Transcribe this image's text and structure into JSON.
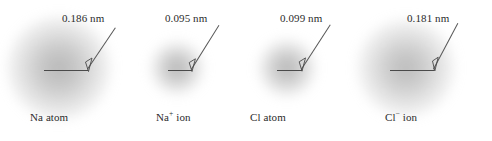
{
  "figure": {
    "background_color": "#ffffff",
    "text_color": "#2b2b2b",
    "line_color": "#4a4a4a",
    "cloud_color": "#9a9a9a",
    "units": "nm"
  },
  "panels": [
    {
      "id": "na-atom",
      "species_label": "Na atom",
      "species_symbol": "Na",
      "charge": "",
      "measure_label": "0.186 nm",
      "radius_nm": 0.186,
      "cloud_diameter_px": 104,
      "cloud_center_x": 59,
      "cloud_center_y": 68,
      "radius_line_left": 44,
      "radius_line_right": 88,
      "radius_line_y": 70,
      "label_x": 62,
      "label_y": 14
    },
    {
      "id": "na-ion",
      "species_label": "Na+ ion",
      "species_symbol": "Na",
      "charge": "+",
      "measure_label": "0.095 nm",
      "radius_nm": 0.095,
      "cloud_diameter_px": 54,
      "cloud_center_x": 177,
      "cloud_center_y": 68,
      "radius_line_left": 168,
      "radius_line_right": 192,
      "radius_line_y": 70,
      "label_x": 177,
      "label_y": 14
    },
    {
      "id": "cl-atom",
      "species_label": "Cl atom",
      "species_symbol": "Cl",
      "charge": "",
      "measure_label": "0.099 nm",
      "radius_nm": 0.099,
      "cloud_diameter_px": 58,
      "cloud_center_x": 287,
      "cloud_center_y": 68,
      "radius_line_left": 277,
      "radius_line_right": 302,
      "radius_line_y": 70,
      "label_x": 292,
      "label_y": 14
    },
    {
      "id": "cl-ion",
      "species_label": "Cl- ion",
      "species_symbol": "Cl",
      "charge": "−",
      "measure_label": "0.181 nm",
      "radius_nm": 0.181,
      "cloud_diameter_px": 98,
      "cloud_center_x": 406,
      "cloud_center_y": 68,
      "radius_line_left": 390,
      "radius_line_right": 434,
      "radius_line_y": 70,
      "label_x": 407,
      "label_y": 14
    }
  ],
  "species_names": {
    "na_atom": "Na atom",
    "na_ion_base": "Na",
    "na_ion_charge": "+",
    "na_ion_suffix": " ion",
    "cl_atom": "Cl atom",
    "cl_ion_base": "Cl",
    "cl_ion_charge": "−",
    "cl_ion_suffix": " ion"
  },
  "measurements": {
    "na_atom": "0.186 nm",
    "na_ion": "0.095 nm",
    "cl_atom": "0.099 nm",
    "cl_ion": "0.181 nm"
  }
}
